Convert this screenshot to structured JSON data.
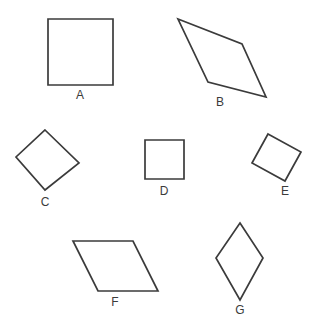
{
  "figure": {
    "background_color": "#ffffff",
    "stroke_color": "#3b3b3b",
    "label_color": "#3b3b3b",
    "width": 318,
    "height": 335
  },
  "shapes": [
    {
      "id": "A",
      "label": "A",
      "kind": "square",
      "points": "48,19 113,19 113,85 48,85",
      "label_x": 80,
      "label_y": 96
    },
    {
      "id": "B",
      "label": "B",
      "kind": "parallelogram-tilted",
      "points": "178,19 242,44 266,97 208,82",
      "label_x": 220,
      "label_y": 103
    },
    {
      "id": "C",
      "label": "C",
      "kind": "diamond-square",
      "points": "45,130 79,163 45,190 16,157",
      "label_x": 45,
      "label_y": 203
    },
    {
      "id": "D",
      "label": "D",
      "kind": "square-small",
      "points": "145,140 184,140 184,179 145,179",
      "label_x": 164,
      "label_y": 192
    },
    {
      "id": "E",
      "label": "E",
      "kind": "rhombus-tilted",
      "points": "268,134 301,152 285,181 252,163",
      "label_x": 285,
      "label_y": 192
    },
    {
      "id": "F",
      "label": "F",
      "kind": "parallelogram",
      "points": "73,241 133,241 158,291 98,291",
      "label_x": 115,
      "label_y": 303
    },
    {
      "id": "G",
      "label": "G",
      "kind": "rhombus-tall",
      "points": "240,223 263,258 240,300 216,258",
      "label_x": 240,
      "label_y": 311
    }
  ]
}
